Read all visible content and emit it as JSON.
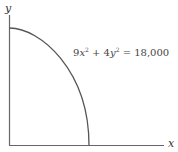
{
  "diagram": {
    "axes": {
      "x_label": "x",
      "y_label": "y"
    },
    "curve": {
      "description": "Quarter ellipse in first quadrant",
      "equation": {
        "coef_x": "9",
        "var_x": "x",
        "exp_x": "2",
        "plus": " + ",
        "coef_y": "4",
        "var_y": "y",
        "exp_y": "2",
        "equals": " = ",
        "rhs": "18,000"
      }
    },
    "colors": {
      "axis": "#555555",
      "curve": "#555555",
      "text": "#444444"
    }
  }
}
